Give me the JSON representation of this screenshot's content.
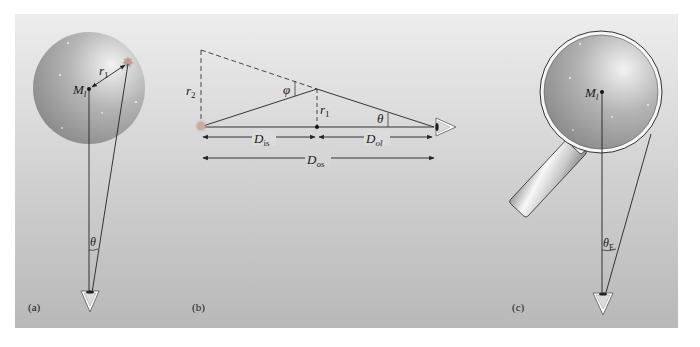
{
  "figure": {
    "panels": [
      {
        "id": "a",
        "caption": "(a)",
        "lens_label": "M",
        "lens_label_sub": "l",
        "radius_label": "r",
        "radius_label_sub": "1",
        "angle_label": "θ"
      },
      {
        "id": "b",
        "caption": "(b)",
        "r2_label": "r",
        "r2_label_sub": "2",
        "r1_label": "r",
        "r1_label_sub": "1",
        "phi_label": "φ",
        "theta_label": "θ",
        "dist_is_label": "D",
        "dist_is_sub": "is",
        "dist_ol_label": "D",
        "dist_ol_sub": "ol",
        "dist_os_label": "D",
        "dist_os_sub": "os"
      },
      {
        "id": "c",
        "caption": "(c)",
        "lens_label": "M",
        "lens_label_sub": "l",
        "angle_label": "θ",
        "angle_label_sub": "E"
      }
    ],
    "colors": {
      "background_top": "#ececec",
      "background_bottom": "#b9b9b9",
      "sphere_light": "#e6e6e6",
      "sphere_dark": "#8a8a8a",
      "line": "#222222"
    }
  }
}
